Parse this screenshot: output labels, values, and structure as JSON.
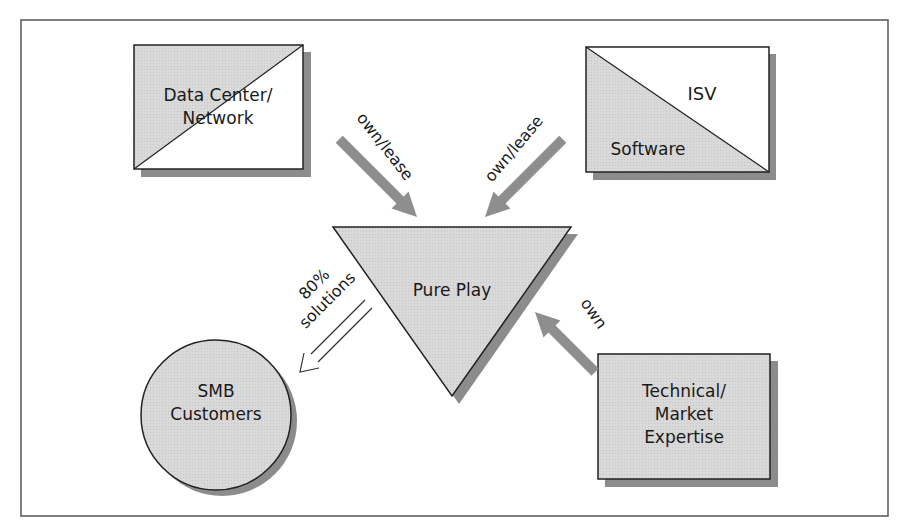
{
  "diagram": {
    "colors": {
      "fill": "#d6d6d6",
      "shadow": "#8c8c8c",
      "arrow": "#8e8e8e",
      "stroke": "#222222",
      "frame": "#555555",
      "background": "#ffffff"
    },
    "nodes": {
      "data_center": {
        "line1": "Data Center/",
        "line2": "Network"
      },
      "isv": {
        "upper": "ISV",
        "lower": "Software"
      },
      "pure_play": {
        "label": "Pure Play"
      },
      "smb": {
        "line1": "SMB",
        "line2": "Customers"
      },
      "expertise": {
        "line1": "Technical/",
        "line2": "Market",
        "line3": "Expertise"
      }
    },
    "edges": {
      "data_center_to_pure_play": {
        "label": "own/lease"
      },
      "isv_to_pure_play": {
        "label": "own/lease"
      },
      "expertise_to_pure_play": {
        "label": "own"
      },
      "pure_play_to_smb": {
        "line1": "80%",
        "line2": "solutions"
      }
    }
  }
}
